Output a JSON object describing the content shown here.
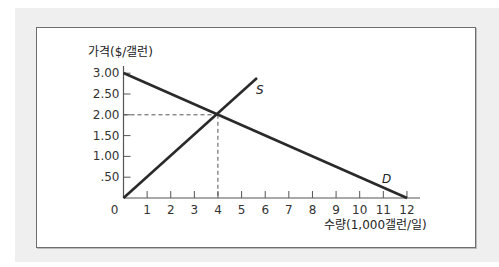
{
  "chart_data": {
    "type": "line",
    "title": "",
    "xlabel": "수량(1,000갤런/일)",
    "ylabel": "가격($/갤런)",
    "xlim": [
      0,
      12
    ],
    "ylim": [
      0,
      3.0
    ],
    "grid": false,
    "x_ticks": [
      "0",
      "1",
      "2",
      "3",
      "4",
      "5",
      "6",
      "7",
      "8",
      "9",
      "10",
      "11",
      "12"
    ],
    "y_ticks": [
      ".50",
      "1.00",
      "1.50",
      "2.00",
      "2.50",
      "3.00"
    ],
    "series": [
      {
        "name": "D",
        "label": "D",
        "points": [
          [
            0,
            3.0
          ],
          [
            12,
            0
          ]
        ]
      },
      {
        "name": "S",
        "label": "S",
        "points": [
          [
            0,
            0
          ],
          [
            5.65,
            2.88
          ]
        ]
      }
    ],
    "equilibrium": {
      "x": 4,
      "y": 2.0,
      "label_x": "4",
      "label_y": "2.00"
    },
    "annotations": [
      {
        "text": "S",
        "near": [
          5.8,
          2.6
        ]
      },
      {
        "text": "D",
        "near": [
          11,
          0.4
        ]
      }
    ]
  },
  "labels": {
    "ylabel": "가격($/갤런)",
    "xlabel": "수량(1,000갤런/일)",
    "origin": "0",
    "supply": "S",
    "demand": "D"
  },
  "colors": {
    "line": "#2a2a2a",
    "axis": "#555555",
    "dash": "#555555",
    "panel": "#efefef"
  }
}
